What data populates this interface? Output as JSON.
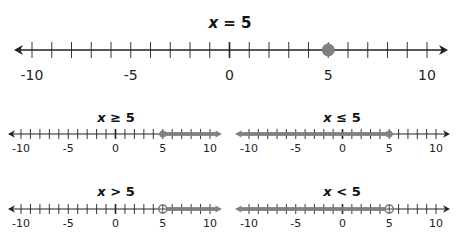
{
  "colors": {
    "line": "#222222",
    "highlight": "#808080"
  },
  "panels": [
    {
      "id": "eq",
      "title": "x = 5",
      "var": "x",
      "op": "=",
      "value": "5",
      "type": "point",
      "closed": true
    },
    {
      "id": "ge",
      "title": "x ≥ 5",
      "var": "x",
      "op": "≥",
      "value": "5",
      "type": "ray-right",
      "closed": true
    },
    {
      "id": "le",
      "title": "x ≤ 5",
      "var": "x",
      "op": "≤",
      "value": "5",
      "type": "ray-left",
      "closed": true
    },
    {
      "id": "gt",
      "title": "x > 5",
      "var": "x",
      "op": ">",
      "value": "5",
      "type": "ray-right",
      "closed": false
    },
    {
      "id": "lt",
      "title": "x < 5",
      "var": "x",
      "op": "<",
      "value": "5",
      "type": "ray-left",
      "closed": false
    }
  ],
  "tick_labels": [
    "-10",
    "-5",
    "0",
    "5",
    "10"
  ],
  "axis": {
    "min": -10,
    "max": 10,
    "step": 1
  }
}
